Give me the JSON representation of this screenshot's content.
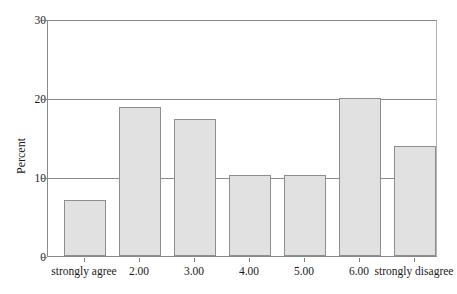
{
  "chart_data": {
    "type": "bar",
    "title": "",
    "subtitle": "",
    "xlabel": "",
    "ylabel": "Percent",
    "categories": [
      "strongly agree",
      "2.00",
      "3.00",
      "4.00",
      "5.00",
      "6.00",
      "strongly disagree"
    ],
    "values": [
      7.1,
      19.0,
      17.5,
      10.4,
      10.4,
      20.2,
      14.1
    ],
    "ylim": [
      0,
      30
    ],
    "yticks": [
      0,
      10,
      20,
      30
    ],
    "ytick_labels": [
      "0",
      "10",
      "20",
      "30"
    ],
    "grid": true,
    "gridlines_at": [
      10,
      20
    ],
    "legend": "none",
    "bar_fill_color": "#e1e1e1",
    "bar_border_color": "#8e8e8e",
    "axis_color": "#8a8a8a",
    "text_color": "#1a1a1a"
  }
}
